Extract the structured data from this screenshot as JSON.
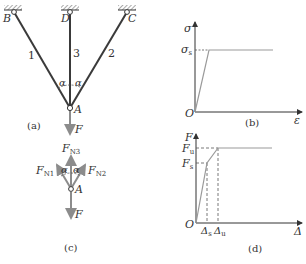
{
  "figure_a": {
    "caption": "(a)",
    "supports": [
      "B",
      "D",
      "C"
    ],
    "bars": [
      "1",
      "3",
      "2"
    ],
    "node": "A",
    "angle": "α",
    "load": "F"
  },
  "figure_b": {
    "caption": "(b)",
    "y_axis": "σ",
    "x_axis": "ε",
    "origin": "O",
    "yield_label": "σ",
    "yield_sub": "s"
  },
  "figure_c": {
    "caption": "(c)",
    "node": "A",
    "angle": "α",
    "forces": {
      "n1": {
        "main": "F",
        "sub": "N1"
      },
      "n2": {
        "main": "F",
        "sub": "N2"
      },
      "n3": {
        "main": "F",
        "sub": "N3"
      }
    },
    "load": "F"
  },
  "figure_d": {
    "caption": "(d)",
    "y_axis": "F",
    "x_axis": "Δ",
    "origin": "O",
    "fu": {
      "main": "F",
      "sub": "u"
    },
    "fs": {
      "main": "F",
      "sub": "s"
    },
    "ds": {
      "main": "Δ",
      "sub": "s"
    },
    "du": {
      "main": "Δ",
      "sub": "u"
    }
  },
  "colors": {
    "bar": "#3a3a3a",
    "curve": "#9a9a9a",
    "arrow": "#9a9a9a",
    "text": "#333333"
  }
}
